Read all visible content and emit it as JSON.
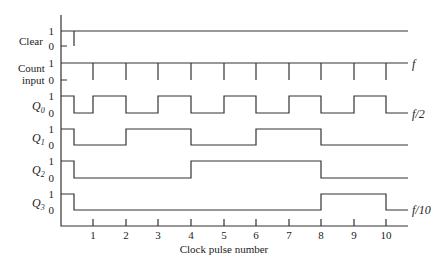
{
  "diagram": {
    "x_axis": {
      "label": "Clock pulse number",
      "ticks": [
        "1",
        "2",
        "3",
        "4",
        "5",
        "6",
        "7",
        "8",
        "9",
        "10"
      ]
    },
    "level_labels": {
      "high": "1",
      "low": "0"
    },
    "signals": [
      {
        "name": "Clear",
        "line2": "",
        "annotation": ""
      },
      {
        "name": "Count",
        "line2": "input",
        "annotation": "f"
      },
      {
        "name": "Q",
        "sub": "0",
        "annotation": "f/2"
      },
      {
        "name": "Q",
        "sub": "1",
        "annotation": ""
      },
      {
        "name": "Q",
        "sub": "2",
        "annotation": ""
      },
      {
        "name": "Q",
        "sub": "3",
        "annotation": "f/10"
      }
    ]
  }
}
